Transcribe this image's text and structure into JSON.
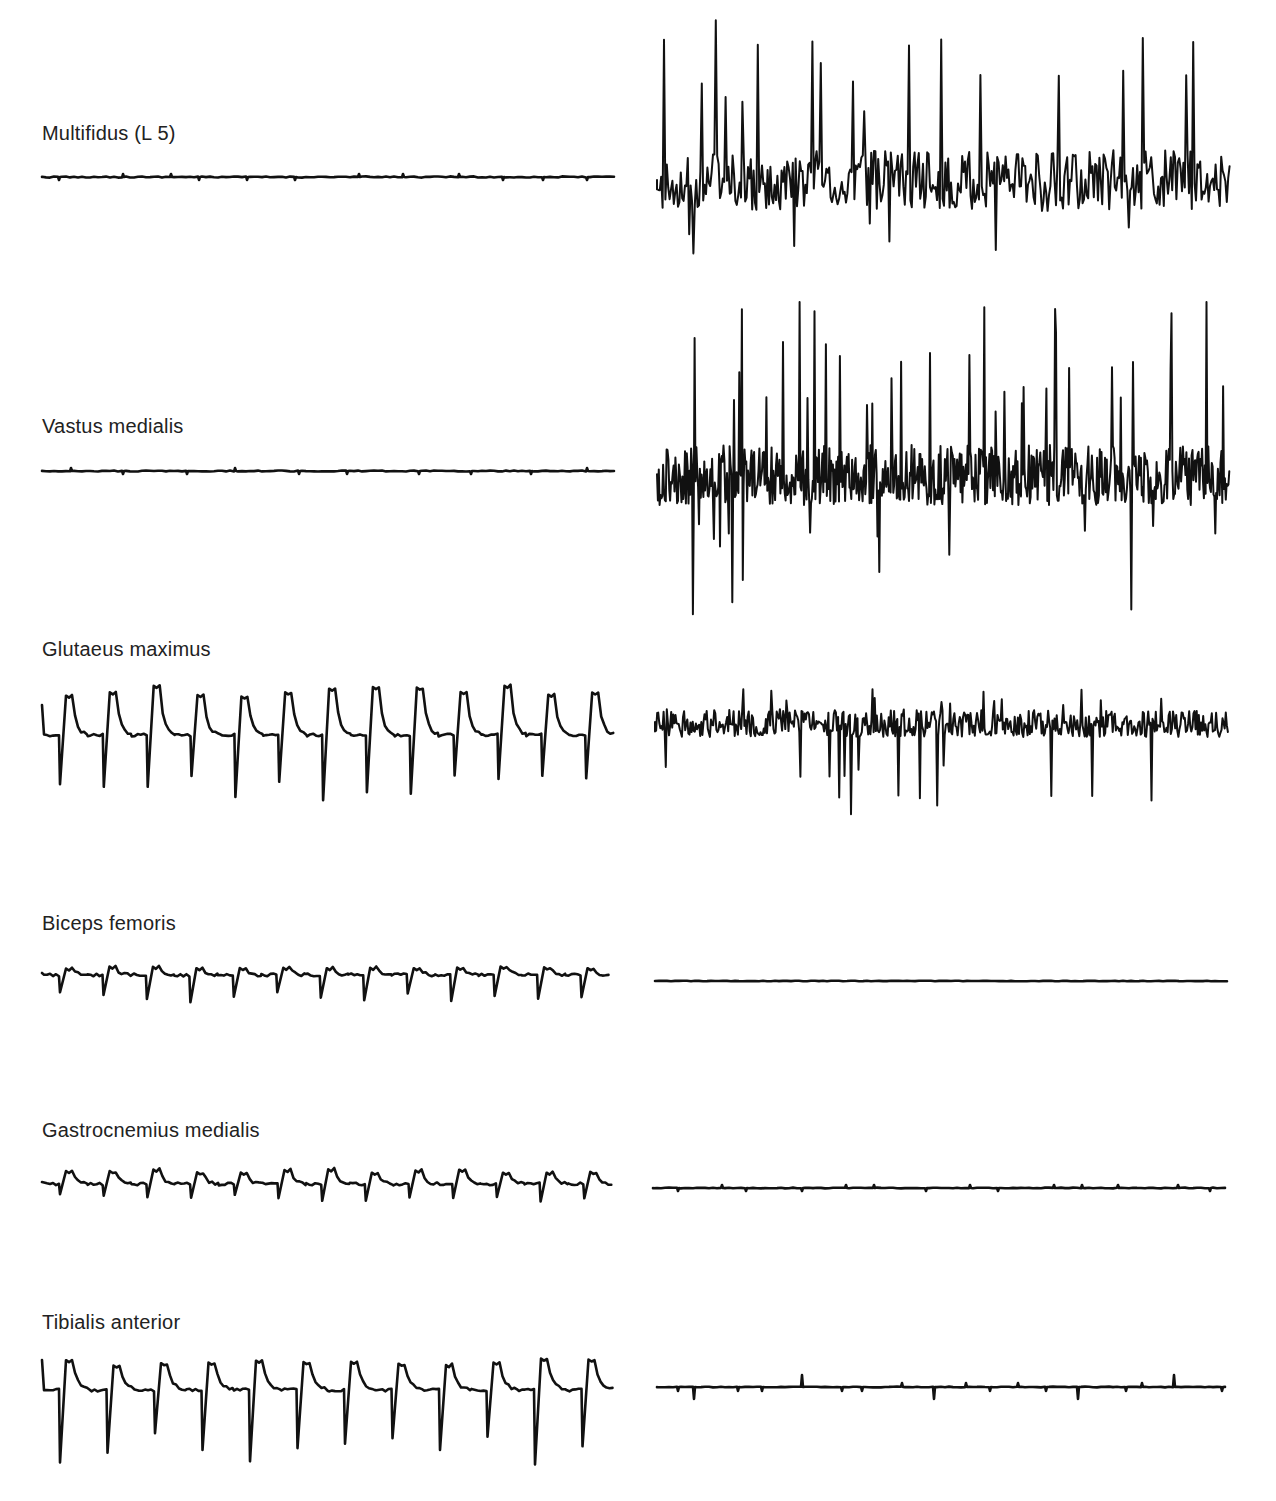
{
  "figure": {
    "columns": [
      "left",
      "right"
    ],
    "rows": [
      {
        "label": "Multifidus (L 5)",
        "label_y": 135,
        "left": {
          "type": "flat",
          "baseline": 177,
          "x0": 42,
          "x1": 615,
          "noise": 1.2,
          "blips": 12
        },
        "right": {
          "type": "burst",
          "baseline": 180,
          "x0": 657,
          "x1": 1230,
          "up": 165,
          "down": 75,
          "density": 1.0
        }
      },
      {
        "label": "Vastus medialis",
        "label_y": 428,
        "left": {
          "type": "flat",
          "baseline": 471,
          "x0": 42,
          "x1": 615,
          "noise": 1.0,
          "blips": 10
        },
        "right": {
          "type": "burst",
          "baseline": 475,
          "x0": 657,
          "x1": 1230,
          "up": 175,
          "down": 140,
          "density": 1.6
        }
      },
      {
        "label": "Glutaeus maximus",
        "label_y": 651,
        "left": {
          "type": "periodic",
          "baseline": 735,
          "x0": 42,
          "x1": 612,
          "period": 46,
          "peak": 47,
          "spike": 70,
          "count": 13
        },
        "right": {
          "type": "burst-small",
          "baseline": 722,
          "x0": 655,
          "x1": 1228,
          "up": 35,
          "down": 95,
          "density": 1.3
        }
      },
      {
        "label": "Biceps femoris",
        "label_y": 925,
        "left": {
          "type": "periodic-small",
          "baseline": 975,
          "x0": 42,
          "x1": 607,
          "period": 45,
          "peak": 8,
          "spike": 28,
          "count": 13
        },
        "right": {
          "type": "flat",
          "baseline": 981,
          "x0": 655,
          "x1": 1227,
          "noise": 0.6,
          "blips": 0
        }
      },
      {
        "label": "Gastrocnemius medialis",
        "label_y": 1132,
        "left": {
          "type": "periodic-small",
          "baseline": 1184,
          "x0": 42,
          "x1": 610,
          "period": 45,
          "peak": 14,
          "spike": 18,
          "count": 13
        },
        "right": {
          "type": "flat",
          "baseline": 1188,
          "x0": 653,
          "x1": 1228,
          "noise": 0.8,
          "blips": 14
        }
      },
      {
        "label": "Tibialis anterior",
        "label_y": 1324,
        "left": {
          "type": "periodic",
          "baseline": 1390,
          "x0": 42,
          "x1": 612,
          "period": 47,
          "peak": 30,
          "spike": 75,
          "count": 12
        },
        "right": {
          "type": "flat-spikes",
          "baseline": 1387,
          "x0": 657,
          "x1": 1228,
          "noise": 0.8,
          "blips": 18
        }
      }
    ],
    "stroke_color": "#111111",
    "background": "#ffffff"
  }
}
